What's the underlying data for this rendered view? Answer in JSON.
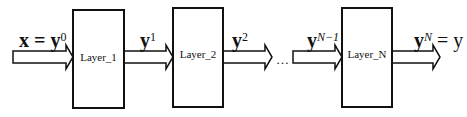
{
  "diagram": {
    "type": "sequential-layer-pipeline",
    "layers": [
      {
        "label": "Layer_1"
      },
      {
        "label": "Layer_2"
      },
      {
        "label": "Layer_N"
      }
    ],
    "signals": [
      {
        "base": "x = y",
        "sup": "0"
      },
      {
        "base": "y",
        "sup": "1"
      },
      {
        "base": "y",
        "sup": "2"
      },
      {
        "base": "y",
        "sup": "N−1"
      },
      {
        "base": "y",
        "sup": "N",
        "suffix": " = y"
      }
    ],
    "ellipsis": "…",
    "colors": {
      "stroke": "#111111",
      "fill": "#ffffff"
    }
  }
}
